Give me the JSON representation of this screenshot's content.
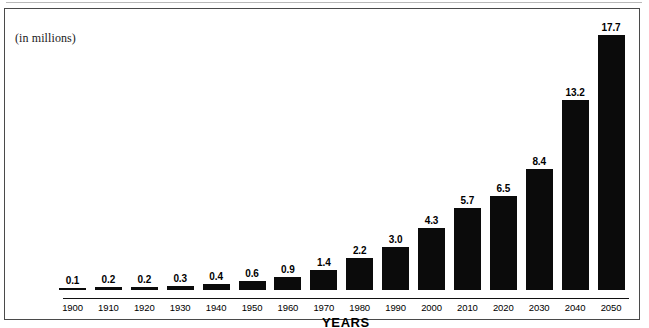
{
  "figure": {
    "units_caption": "(in millions)",
    "x_axis_title": "YEARS",
    "frame_color": "#4a4a4a",
    "bar_color": "#0b0b0b",
    "background_color": "#ffffff"
  },
  "chart_data": {
    "type": "bar",
    "title": "",
    "subtitle": "(in millions)",
    "xlabel": "YEARS",
    "ylabel": "",
    "categories": [
      "1900",
      "1910",
      "1920",
      "1930",
      "1940",
      "1950",
      "1960",
      "1970",
      "1980",
      "1990",
      "2000",
      "2010",
      "2020",
      "2030",
      "2040",
      "2050"
    ],
    "values": [
      0.1,
      0.2,
      0.2,
      0.3,
      0.4,
      0.6,
      0.9,
      1.4,
      2.2,
      3.0,
      4.3,
      5.7,
      6.5,
      8.4,
      13.2,
      17.7
    ],
    "data_labels": [
      "0.1",
      "0.2",
      "0.2",
      "0.3",
      "0.4",
      "0.6",
      "0.9",
      "1.4",
      "2.2",
      "3.0",
      "4.3",
      "5.7",
      "6.5",
      "8.4",
      "13.2",
      "17.7"
    ],
    "ylim": [
      0,
      17.7
    ],
    "grid": false,
    "legend": null,
    "series": [
      {
        "name": "population",
        "values": [
          0.1,
          0.2,
          0.2,
          0.3,
          0.4,
          0.6,
          0.9,
          1.4,
          2.2,
          3.0,
          4.3,
          5.7,
          6.5,
          8.4,
          13.2,
          17.7
        ]
      }
    ]
  }
}
